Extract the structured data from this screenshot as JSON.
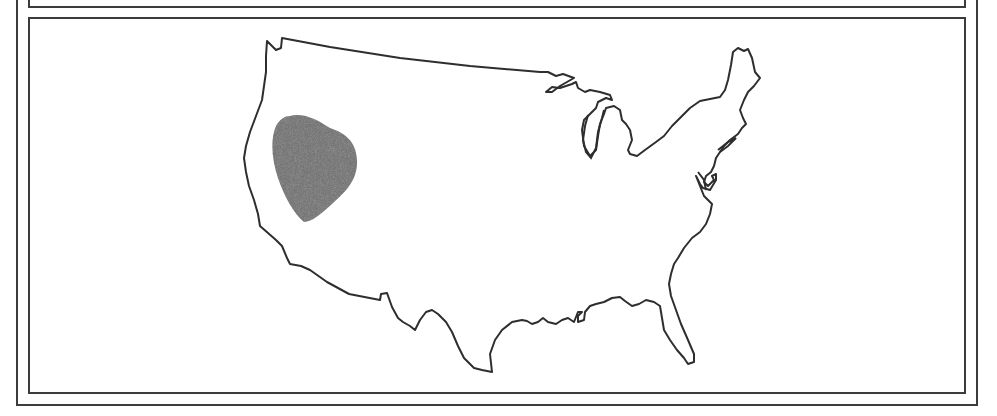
{
  "figure": {
    "type": "choropleth-outline-map",
    "region": "Contiguous United States",
    "highlight": {
      "label": "shaded region",
      "location": "Nevada / western Great Basin",
      "color": "#6b6b6b"
    },
    "outline_color": "#2e2e2e",
    "frame_color": "#3c3c3c",
    "background": "#ffffff"
  }
}
